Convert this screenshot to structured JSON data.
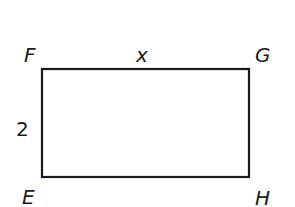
{
  "diagram": {
    "type": "rectangle",
    "stroke_color": "#1a1a1a",
    "vertices": {
      "F": "F",
      "G": "G",
      "H": "H",
      "E": "E"
    },
    "side_labels": {
      "top_FG": "x",
      "left_FE": "2"
    }
  }
}
